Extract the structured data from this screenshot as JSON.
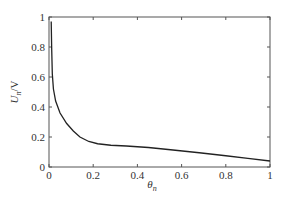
{
  "chart_data": {
    "type": "line",
    "title": "",
    "xlabel": "θn",
    "ylabel": "Un/V",
    "xlabel_main": "θ",
    "xlabel_sub": "n",
    "ylabel_main": "U",
    "ylabel_sub": "n",
    "ylabel_unit": "/V",
    "xlim": [
      0,
      1
    ],
    "ylim": [
      0,
      1
    ],
    "xticks": [
      0,
      0.2,
      0.4,
      0.6,
      0.8,
      1
    ],
    "xtick_labels": [
      "0",
      "0.2",
      "0.4",
      "0.6",
      "0.8",
      "1"
    ],
    "yticks": [
      0,
      0.2,
      0.4,
      0.6,
      0.8,
      1
    ],
    "ytick_labels": [
      "0",
      "0.2",
      "0.4",
      "0.6",
      "0.8",
      "1"
    ],
    "grid": false,
    "legend": null,
    "series": [
      {
        "name": "Un",
        "color": "#222222",
        "x": [
          0.01,
          0.012,
          0.015,
          0.02,
          0.03,
          0.05,
          0.08,
          0.11,
          0.14,
          0.18,
          0.22,
          0.28,
          0.35,
          0.45,
          0.55,
          0.68,
          0.8,
          0.9,
          1.0
        ],
        "y": [
          0.97,
          0.8,
          0.62,
          0.52,
          0.44,
          0.36,
          0.29,
          0.24,
          0.2,
          0.17,
          0.155,
          0.145,
          0.14,
          0.13,
          0.115,
          0.095,
          0.075,
          0.058,
          0.04
        ]
      }
    ]
  }
}
